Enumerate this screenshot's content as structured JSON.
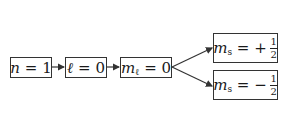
{
  "diagram": {
    "nodes": [
      {
        "id": "n",
        "var": "n",
        "sub": "",
        "op": " = ",
        "value": "1"
      },
      {
        "id": "l",
        "var": "ℓ",
        "sub": "",
        "op": " = ",
        "value": "0"
      },
      {
        "id": "ml",
        "var": "m",
        "sub": "ℓ",
        "op": " = ",
        "value": "0"
      },
      {
        "id": "ms_plus",
        "var": "m",
        "sub": "s",
        "op": " = ",
        "sign": "+",
        "num": "1",
        "den": "2"
      },
      {
        "id": "ms_minus",
        "var": "m",
        "sub": "s",
        "op": " = ",
        "sign": "−",
        "num": "1",
        "den": "2"
      }
    ],
    "edges": [
      {
        "from": "n",
        "to": "l"
      },
      {
        "from": "l",
        "to": "ml"
      },
      {
        "from": "ml",
        "to": "ms_plus"
      },
      {
        "from": "ml",
        "to": "ms_minus"
      }
    ],
    "colors": {
      "line": "#333333",
      "background": "#ffffff"
    }
  }
}
